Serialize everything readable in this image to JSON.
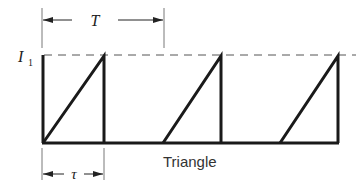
{
  "diagram": {
    "caption": "Triangle",
    "amplitude_label": "I",
    "amplitude_subscript": "1",
    "period_label": "T",
    "pulse_width_label": "τ",
    "waveform": {
      "type": "sawtooth-ramp",
      "pulses": 3,
      "description": "Linear ramp from 0 to I1 over duration τ, then sharp drop to 0; repeats every period T"
    },
    "colors": {
      "line": "#1a1a1a",
      "dashed": "#555555",
      "background": "#ffffff"
    }
  }
}
